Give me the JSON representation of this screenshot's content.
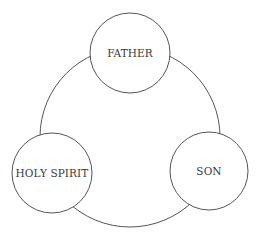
{
  "diagram": {
    "type": "cycle",
    "stroke_color": "#555555",
    "ring": {
      "cx": 130,
      "cy": 137,
      "r": 90
    },
    "nodes": [
      {
        "id": "father",
        "label": "FATHER",
        "cx": 130,
        "cy": 53,
        "r": 40
      },
      {
        "id": "son",
        "label": "SON",
        "cx": 209,
        "cy": 171,
        "r": 39
      },
      {
        "id": "holy-spirit",
        "label": "HOLY SPIRIT",
        "cx": 52,
        "cy": 173,
        "r": 40
      }
    ]
  }
}
